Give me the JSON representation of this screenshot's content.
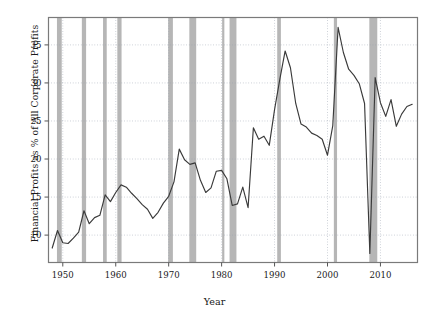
{
  "chart_data": {
    "type": "line",
    "title": "",
    "xlabel": "Year",
    "ylabel": "Financial Profits as % of All Corporate Profits",
    "xlim": [
      1947.3,
      2017.0
    ],
    "ylim": [
      6.4,
      38.6
    ],
    "xticks": [
      1950,
      1960,
      1970,
      1980,
      1990,
      2000,
      2010
    ],
    "xticklabels": [
      "1950",
      "1960",
      "1970",
      "1980",
      "1990",
      "2000",
      "2010"
    ],
    "yticks": [
      10,
      15,
      20,
      25,
      30,
      35
    ],
    "yticklabels": [
      "10",
      "15",
      "20",
      "25",
      "30",
      "35"
    ],
    "grid": true,
    "grid_style": "dotted",
    "legend": "none",
    "line_color": "#3a3a3a",
    "shade_color": "#b0b0b0",
    "x": [
      1948,
      1949,
      1950,
      1951,
      1952,
      1953,
      1954,
      1955,
      1956,
      1957,
      1958,
      1959,
      1960,
      1961,
      1962,
      1963,
      1964,
      1965,
      1966,
      1967,
      1968,
      1969,
      1970,
      1971,
      1972,
      1973,
      1974,
      1975,
      1976,
      1977,
      1978,
      1979,
      1980,
      1981,
      1982,
      1983,
      1984,
      1985,
      1986,
      1987,
      1988,
      1989,
      1990,
      1991,
      1992,
      1993,
      1994,
      1995,
      1996,
      1997,
      1998,
      1999,
      2000,
      2001,
      2002,
      2003,
      2004,
      2005,
      2006,
      2007,
      2008,
      2009,
      2010,
      2011,
      2012,
      2013,
      2014,
      2015,
      2016
    ],
    "values": [
      8.3,
      10.6,
      9.0,
      8.9,
      9.6,
      10.4,
      13.2,
      11.5,
      12.3,
      12.6,
      15.3,
      14.4,
      15.6,
      16.6,
      16.3,
      15.5,
      14.8,
      14.0,
      13.4,
      12.2,
      13.0,
      14.2,
      15.1,
      17.0,
      21.3,
      19.9,
      19.3,
      19.5,
      17.2,
      15.6,
      16.2,
      18.4,
      18.5,
      17.4,
      13.9,
      14.1,
      16.3,
      13.6,
      24.1,
      22.6,
      23.0,
      21.8,
      26.5,
      30.5,
      34.2,
      32.0,
      27.3,
      24.6,
      24.2,
      23.4,
      23.1,
      22.6,
      20.5,
      24.4,
      37.3,
      34.0,
      31.8,
      31.0,
      29.9,
      27.3,
      7.6,
      30.7,
      27.4,
      25.6,
      27.8,
      24.3,
      25.9,
      26.9,
      27.2
    ],
    "annotations": {
      "shaded_bands_name": "US recessions (NBER)",
      "recessions": [
        {
          "start": 1948.9,
          "end": 1949.8
        },
        {
          "start": 1953.6,
          "end": 1954.4
        },
        {
          "start": 1957.6,
          "end": 1958.3
        },
        {
          "start": 1960.3,
          "end": 1961.1
        },
        {
          "start": 1969.9,
          "end": 1970.8
        },
        {
          "start": 1973.9,
          "end": 1975.2
        },
        {
          "start": 1980.1,
          "end": 1980.5
        },
        {
          "start": 1981.5,
          "end": 1982.8
        },
        {
          "start": 1990.5,
          "end": 1991.2
        },
        {
          "start": 2001.2,
          "end": 2001.8
        },
        {
          "start": 2007.9,
          "end": 2009.4
        }
      ]
    }
  },
  "axes": {
    "x_title": "Year",
    "y_title": "Financial Profits as % of All Corporate Profits"
  }
}
